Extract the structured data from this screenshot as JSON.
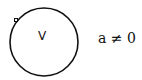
{
  "diagram": {
    "circle": {
      "cx": 44,
      "cy": 42,
      "r": 34,
      "stroke": "#111111"
    },
    "marker": {
      "x": 16,
      "y": 20,
      "type": "open-square"
    },
    "inner_label": "V",
    "condition_label": "a ≠ 0"
  }
}
